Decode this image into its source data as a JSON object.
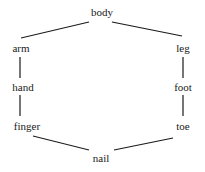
{
  "diagram": {
    "type": "lattice",
    "nodes": [
      {
        "id": "body",
        "label": "body",
        "x": 102,
        "y": 7
      },
      {
        "id": "arm",
        "label": "arm",
        "x": 21,
        "y": 43
      },
      {
        "id": "leg",
        "label": "leg",
        "x": 183,
        "y": 43
      },
      {
        "id": "hand",
        "label": "hand",
        "x": 23,
        "y": 82
      },
      {
        "id": "foot",
        "label": "foot",
        "x": 183,
        "y": 82
      },
      {
        "id": "finger",
        "label": "finger",
        "x": 27,
        "y": 121
      },
      {
        "id": "toe",
        "label": "toe",
        "x": 183,
        "y": 121
      },
      {
        "id": "nail",
        "label": "nail",
        "x": 101,
        "y": 153
      }
    ],
    "edges": [
      {
        "from": "body",
        "to": "arm"
      },
      {
        "from": "body",
        "to": "leg"
      },
      {
        "from": "arm",
        "to": "hand"
      },
      {
        "from": "leg",
        "to": "foot"
      },
      {
        "from": "hand",
        "to": "finger"
      },
      {
        "from": "foot",
        "to": "toe"
      },
      {
        "from": "finger",
        "to": "nail"
      },
      {
        "from": "toe",
        "to": "nail"
      }
    ]
  }
}
